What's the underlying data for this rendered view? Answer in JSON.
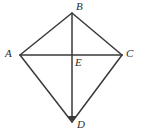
{
  "figure": {
    "kind": "geometry-diagram",
    "shape_name": "kite",
    "background_color": "#ffffff",
    "stroke_color": "#3a3a3a",
    "label_color": "#2b2b2b",
    "stroke_width": 1.5,
    "width": 144,
    "height": 134,
    "points": {
      "A": {
        "label": "A",
        "x": 20,
        "y": 55,
        "label_x": 5,
        "label_y": 48
      },
      "B": {
        "label": "B",
        "x": 72,
        "y": 13,
        "label_x": 76,
        "label_y": 1
      },
      "C": {
        "label": "C",
        "x": 122,
        "y": 55,
        "label_x": 126,
        "label_y": 48
      },
      "D": {
        "label": "D",
        "x": 72,
        "y": 122,
        "label_x": 77,
        "label_y": 119
      },
      "E": {
        "label": "E",
        "x": 72,
        "y": 55,
        "label_x": 75,
        "label_y": 57
      }
    },
    "sides": [
      {
        "name": "side-AB",
        "from": "A",
        "to": "B"
      },
      {
        "name": "side-BC",
        "from": "B",
        "to": "C"
      },
      {
        "name": "side-CD",
        "from": "C",
        "to": "D"
      },
      {
        "name": "side-DA",
        "from": "D",
        "to": "A"
      }
    ],
    "diagonals": [
      {
        "name": "diagonal-AC",
        "from": "A",
        "to": "C",
        "orientation": "horizontal",
        "arrow": "none"
      },
      {
        "name": "diagonal-BD",
        "from": "B",
        "to": "D",
        "orientation": "vertical",
        "arrow": "end"
      }
    ]
  }
}
